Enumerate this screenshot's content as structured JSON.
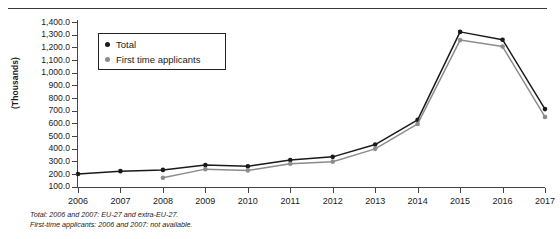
{
  "chart_data": {
    "type": "line",
    "title": "",
    "xlabel": "",
    "ylabel": "(Thousands)",
    "ylim": [
      0,
      1400
    ],
    "grid": false,
    "legend_position": "top-left-inside",
    "categories": [
      "2006",
      "2007",
      "2008",
      "2009",
      "2010",
      "2011",
      "2012",
      "2013",
      "2014",
      "2015",
      "2016",
      "2017"
    ],
    "x_tick_labels": [
      "2006",
      "2007",
      "2008",
      "2009",
      "2010",
      "2011",
      "2012",
      "2013",
      "2014",
      "2015",
      "2016",
      "2017"
    ],
    "y_tick_labels": [
      "1,400.0",
      "1,300.0",
      "1,200.0",
      "1,100.0",
      "1,000.0",
      "900.0",
      "800.0",
      "700.0",
      "600.0",
      "500.0",
      "400.0",
      "300.0",
      "200.0",
      "100.0"
    ],
    "y_tick_values": [
      1400,
      1300,
      1200,
      1100,
      1000,
      900,
      800,
      700,
      600,
      500,
      400,
      300,
      200,
      100
    ],
    "series": [
      {
        "name": "Total",
        "color": "#1a1a1a",
        "marker": "circle",
        "values": [
          200,
          222,
          232,
          270,
          260,
          310,
          335,
          432,
          627,
          1322,
          1260,
          712
        ]
      },
      {
        "name": "First time applicants",
        "color": "#8c8c8c",
        "marker": "circle",
        "values": [
          null,
          null,
          170,
          238,
          228,
          280,
          297,
          398,
          595,
          1257,
          1206,
          650
        ]
      }
    ],
    "annotations": [
      "Total: 2006 and 2007: EU-27 and extra-EU-27.",
      "First-time applicants: 2006 and 2007: not available."
    ]
  },
  "legend": {
    "items": [
      {
        "label": "Total",
        "color": "#1a1a1a"
      },
      {
        "label": "First time applicants",
        "color": "#8c8c8c"
      }
    ]
  },
  "footnotes": {
    "line1": "Total: 2006 and 2007: EU-27 and extra-EU-27.",
    "line2": "First-time applicants: 2006 and 2007: not available."
  }
}
